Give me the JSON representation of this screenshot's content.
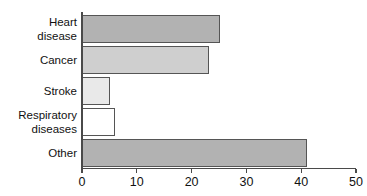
{
  "chart_data": {
    "type": "bar",
    "orientation": "horizontal",
    "title": "",
    "subtitle": "",
    "xlabel": "",
    "ylabel": "",
    "categories": [
      "Heart disease",
      "Cancer",
      "Stroke",
      "Respiratory diseases",
      "Other"
    ],
    "values": [
      25,
      23,
      5,
      6,
      41
    ],
    "bar_colors": [
      "#b2b2b2",
      "#cfcfcf",
      "#e9e9e9",
      "#ffffff",
      "#b2b2b2"
    ],
    "bar_edge_color": "#555555",
    "xlim": [
      0,
      50
    ],
    "xticks": [
      0,
      10,
      20,
      30,
      40,
      50
    ],
    "xtick_labels": [
      "0",
      "10",
      "20",
      "30",
      "40",
      "50"
    ],
    "grid": false,
    "legend": false,
    "legend_position": "none",
    "axis_color": "#4a4a4a",
    "background_color": "#ffffff"
  }
}
